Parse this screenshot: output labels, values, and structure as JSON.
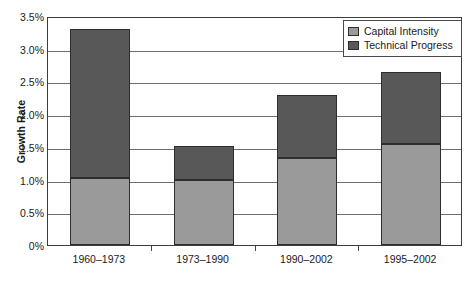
{
  "chart_data": {
    "type": "bar",
    "subtype": "stacked-bar",
    "title": "",
    "xlabel": "",
    "ylabel": "Growth Rate",
    "categories": [
      "1960–1973",
      "1973–1990",
      "1990–2002",
      "1995–2002"
    ],
    "series": [
      {
        "name": "Capital Intensity",
        "color": "#9a9a9a",
        "values": [
          1.02,
          0.99,
          1.33,
          1.54
        ]
      },
      {
        "name": "Technical Progress",
        "color": "#585858",
        "values": [
          2.28,
          0.53,
          0.96,
          1.11
        ]
      }
    ],
    "totals": [
      3.3,
      1.52,
      2.29,
      2.65
    ],
    "ylim": [
      0,
      3.5
    ],
    "ytick_values": [
      0,
      0.5,
      1.0,
      1.5,
      2.0,
      2.5,
      3.0,
      3.5
    ],
    "ytick_labels": [
      "0%",
      "0.5%",
      "1.0%",
      "1.5%",
      "2.0%",
      "2.5%",
      "3.0%",
      "3.5%"
    ],
    "grid": true,
    "grid_axis": "y",
    "legend_position": "top-right",
    "legend_entries": [
      "Capital Intensity",
      "Technical Progress"
    ],
    "colors": {
      "capital_intensity": "#9a9a9a",
      "technical_progress": "#585858",
      "frame": "#3c3c3c",
      "gridline": "#6e6e6e",
      "background": "#ffffff",
      "text": "#1a1a1a"
    }
  }
}
